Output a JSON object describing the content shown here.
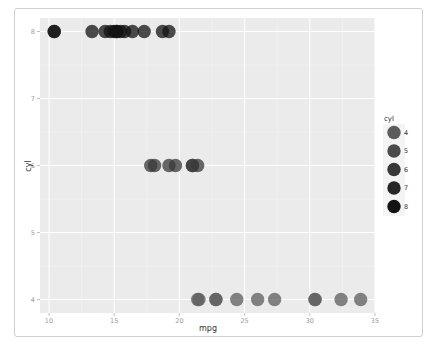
{
  "chart_data": {
    "type": "scatter",
    "title": "",
    "xlabel": "mpg",
    "ylabel": "cyl",
    "xlim": [
      9.2,
      35
    ],
    "ylim": [
      3.8,
      8.2
    ],
    "x_ticks": [
      10,
      15,
      20,
      25,
      30,
      35
    ],
    "y_ticks": [
      4,
      5,
      6,
      7,
      8
    ],
    "grid": true,
    "legend": {
      "title": "cyl",
      "position": "right",
      "entries": [
        {
          "label": "4",
          "color": "#5c5c5c"
        },
        {
          "label": "5",
          "color": "#4a4a4a"
        },
        {
          "label": "6",
          "color": "#383838"
        },
        {
          "label": "7",
          "color": "#262626"
        },
        {
          "label": "8",
          "color": "#131313"
        }
      ]
    },
    "series": [
      {
        "name": "8",
        "color": "#131313",
        "points": [
          [
            10.4,
            8
          ],
          [
            10.4,
            8
          ],
          [
            13.3,
            8
          ],
          [
            14.3,
            8
          ],
          [
            14.7,
            8
          ],
          [
            15.0,
            8
          ],
          [
            15.2,
            8
          ],
          [
            15.2,
            8
          ],
          [
            15.5,
            8
          ],
          [
            15.8,
            8
          ],
          [
            16.4,
            8
          ],
          [
            17.3,
            8
          ],
          [
            18.7,
            8
          ],
          [
            19.2,
            8
          ]
        ]
      },
      {
        "name": "6",
        "color": "#383838",
        "points": [
          [
            17.8,
            6
          ],
          [
            18.1,
            6
          ],
          [
            19.2,
            6
          ],
          [
            19.7,
            6
          ],
          [
            21.0,
            6
          ],
          [
            21.0,
            6
          ],
          [
            21.4,
            6
          ]
        ]
      },
      {
        "name": "4",
        "color": "#5c5c5c",
        "points": [
          [
            21.4,
            4
          ],
          [
            21.5,
            4
          ],
          [
            22.8,
            4
          ],
          [
            22.8,
            4
          ],
          [
            24.4,
            4
          ],
          [
            26.0,
            4
          ],
          [
            27.3,
            4
          ],
          [
            30.4,
            4
          ],
          [
            30.4,
            4
          ],
          [
            32.4,
            4
          ],
          [
            33.9,
            4
          ]
        ]
      }
    ]
  },
  "colors": {
    "panel_bg": "#ebebeb",
    "grid_major": "#ffffff",
    "grid_minor": "#f3f3f3"
  }
}
